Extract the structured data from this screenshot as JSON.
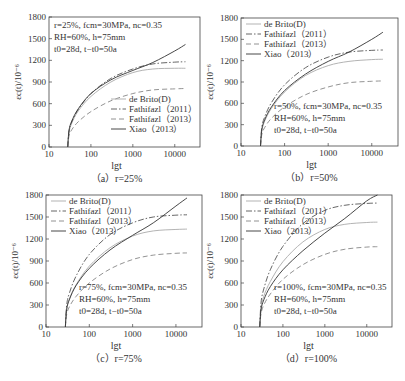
{
  "figure": {
    "ylabel": "εc(t)/10⁻⁶",
    "xlabel": "lgt"
  },
  "chart_data": [
    {
      "type": "line",
      "panel": "a",
      "caption": "（a）r=25%",
      "xlabel": "lgt",
      "ylabel": "εc(t)/10⁻⁶",
      "xscale": "log",
      "xlim": [
        10,
        40000
      ],
      "ylim": [
        0,
        1800
      ],
      "xticks": [
        10,
        100,
        1000,
        10000
      ],
      "yticks": [
        0,
        300,
        600,
        900,
        1200,
        1500,
        1800
      ],
      "annotation": [
        "r=25%, fcm=30MPa, nc=0.35",
        "RH=60%, h=75mm",
        "t0=28d, t−t0=50a"
      ],
      "annotation_pos": "top-left",
      "legend_pos": "bottom-right",
      "x": [
        28,
        30,
        35,
        50,
        100,
        300,
        1000,
        3000,
        10000,
        18000
      ],
      "series": [
        {
          "name": "de Brito(D)",
          "style": "dotted-light",
          "values": [
            0,
            200,
            330,
            500,
            700,
            900,
            1030,
            1080,
            1090,
            1090
          ]
        },
        {
          "name": "Fathifazl（2011）",
          "style": "dashdot",
          "values": [
            0,
            220,
            350,
            520,
            740,
            950,
            1080,
            1150,
            1175,
            1180
          ]
        },
        {
          "name": "Fathifazl（2013）",
          "style": "dashed",
          "values": [
            0,
            150,
            240,
            350,
            490,
            640,
            740,
            790,
            805,
            810
          ]
        },
        {
          "name": "Xiao（2013）",
          "style": "solid",
          "values": [
            0,
            230,
            360,
            530,
            740,
            930,
            1060,
            1170,
            1330,
            1420
          ]
        }
      ]
    },
    {
      "type": "line",
      "panel": "b",
      "caption": "（b）r=50%",
      "xlabel": "lgt",
      "ylabel": "εc(t)/10⁻⁶",
      "xscale": "log",
      "xlim": [
        10,
        40000
      ],
      "ylim": [
        0,
        1800
      ],
      "xticks": [
        10,
        100,
        1000,
        10000
      ],
      "yticks": [
        0,
        300,
        600,
        900,
        1200,
        1500,
        1800
      ],
      "annotation": [
        "r=50%, fcm=30MPa, nc=0.35",
        "RH=60%, h=75mm",
        "t0=28d, t−t0=50a"
      ],
      "annotation_pos": "bottom-right",
      "legend_pos": "top-left",
      "x": [
        28,
        30,
        35,
        50,
        100,
        300,
        1000,
        3000,
        10000,
        18000
      ],
      "series": [
        {
          "name": "de Brito(D)",
          "style": "dotted-light",
          "values": [
            0,
            210,
            350,
            530,
            760,
            990,
            1130,
            1190,
            1215,
            1220
          ]
        },
        {
          "name": "Fathifazl（2011）",
          "style": "dashdot",
          "values": [
            0,
            260,
            410,
            610,
            860,
            1100,
            1250,
            1320,
            1345,
            1350
          ]
        },
        {
          "name": "Fathifazl（2013）",
          "style": "dashed",
          "values": [
            0,
            160,
            260,
            390,
            550,
            720,
            830,
            890,
            910,
            915
          ]
        },
        {
          "name": "Xiao（2013）",
          "style": "solid",
          "values": [
            0,
            230,
            370,
            550,
            780,
            1010,
            1190,
            1320,
            1500,
            1600
          ]
        }
      ]
    },
    {
      "type": "line",
      "panel": "c",
      "caption": "（c）r=75%",
      "xlabel": "lgt",
      "ylabel": "εc(t)/10⁻⁶",
      "xscale": "log",
      "xlim": [
        10,
        40000
      ],
      "ylim": [
        0,
        1800
      ],
      "xticks": [
        10,
        100,
        1000,
        10000
      ],
      "yticks": [
        0,
        300,
        600,
        900,
        1200,
        1500,
        1800
      ],
      "annotation": [
        "r=75%, fcm=30MPa, nc=0.35",
        "RH=60%, h=75mm",
        "t0=28d, t−t0=50a"
      ],
      "annotation_pos": "bottom-right",
      "legend_pos": "top-left",
      "x": [
        28,
        30,
        35,
        50,
        100,
        300,
        1000,
        3000,
        10000,
        18000
      ],
      "series": [
        {
          "name": "de Brito(D)",
          "style": "dotted-light",
          "values": [
            0,
            240,
            390,
            580,
            830,
            1080,
            1240,
            1310,
            1330,
            1335
          ]
        },
        {
          "name": "Fathifazl（2011）",
          "style": "dashdot",
          "values": [
            0,
            300,
            470,
            700,
            990,
            1260,
            1420,
            1500,
            1525,
            1530
          ]
        },
        {
          "name": "Fathifazl（2013）",
          "style": "dashed",
          "values": [
            0,
            170,
            280,
            420,
            600,
            790,
            920,
            980,
            1005,
            1010
          ]
        },
        {
          "name": "Xiao（2013）",
          "style": "solid",
          "values": [
            0,
            240,
            380,
            570,
            800,
            1050,
            1250,
            1420,
            1650,
            1760
          ]
        }
      ]
    },
    {
      "type": "line",
      "panel": "d",
      "caption": "（d）r=100%",
      "xlabel": "lgt",
      "ylabel": "εc(t)/10⁻⁶",
      "xscale": "log",
      "xlim": [
        10,
        40000
      ],
      "ylim": [
        0,
        1800
      ],
      "xticks": [
        10,
        100,
        1000,
        10000
      ],
      "yticks": [
        0,
        300,
        600,
        900,
        1200,
        1500,
        1800
      ],
      "annotation": [
        "r=100%, fcm=30MPa, nc=0.35",
        "RH=60%, h=75mm",
        "t0=28d, t−t0=50a"
      ],
      "annotation_pos": "bottom-right",
      "legend_pos": "top-left",
      "x": [
        28,
        30,
        35,
        50,
        100,
        300,
        1000,
        3000,
        10000,
        18000
      ],
      "series": [
        {
          "name": "de Brito(D)",
          "style": "dotted-light",
          "values": [
            0,
            260,
            420,
            620,
            890,
            1160,
            1330,
            1400,
            1425,
            1430
          ]
        },
        {
          "name": "Fathifazl（2011）",
          "style": "dashdot",
          "values": [
            0,
            330,
            520,
            780,
            1100,
            1410,
            1590,
            1660,
            1685,
            1690
          ]
        },
        {
          "name": "Fathifazl（2013）",
          "style": "dashed",
          "values": [
            0,
            180,
            300,
            450,
            650,
            850,
            990,
            1060,
            1090,
            1095
          ]
        },
        {
          "name": "Xiao（2013）",
          "style": "solid",
          "values": [
            0,
            230,
            370,
            550,
            780,
            1040,
            1280,
            1480,
            1720,
            1800
          ]
        }
      ]
    }
  ]
}
